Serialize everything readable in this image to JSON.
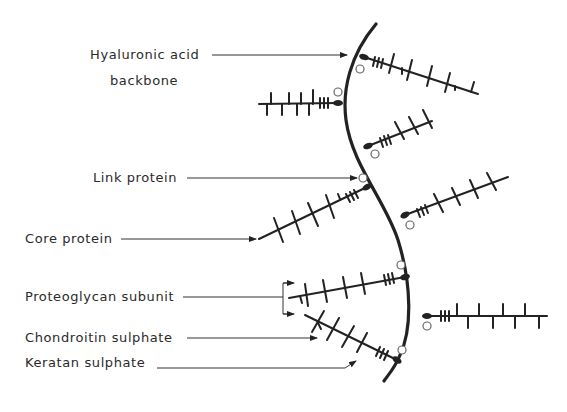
{
  "diagram": {
    "colors": {
      "ink": "#222222",
      "background": "#ffffff",
      "label": "#2a2a2a"
    },
    "labels": [
      {
        "id": "hyaluronic",
        "line1": "Hyaluronic acid",
        "line2": "backbone"
      },
      {
        "id": "link",
        "text": "Link protein"
      },
      {
        "id": "core",
        "text": "Core protein"
      },
      {
        "id": "subunit",
        "text": "Proteoglycan subunit"
      },
      {
        "id": "chondroitin",
        "text": "Chondroitin sulphate"
      },
      {
        "id": "keratan",
        "text": "Keratan sulphate"
      }
    ],
    "components": {
      "backbone": "Hyaluronic acid backbone (curved line)",
      "subunits_count": 9,
      "link_proteins_count": 9
    }
  }
}
